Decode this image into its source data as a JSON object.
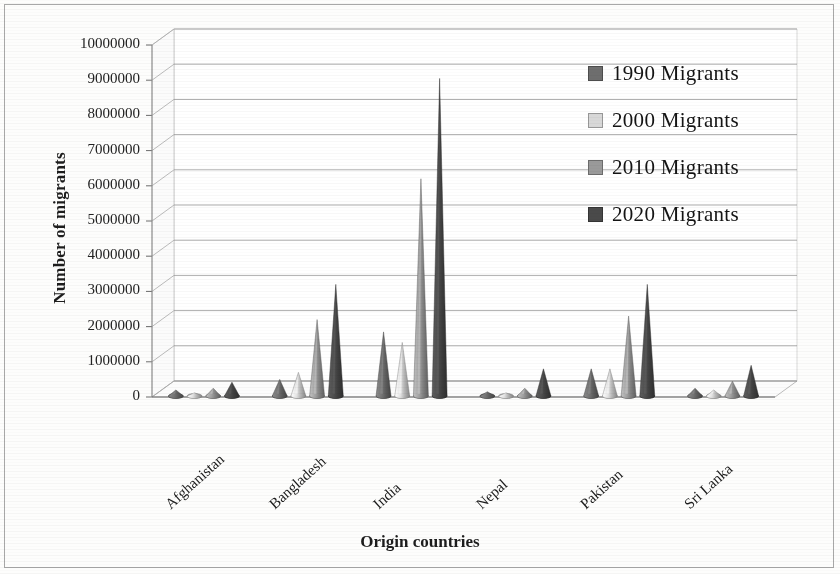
{
  "figure": {
    "background_color": "#fdfdfc",
    "frame_color": "#a8a8a8"
  },
  "axes": {
    "y_title": "Number of migrants",
    "x_title": "Origin countries",
    "y_ticks": [
      "0",
      "1000000",
      "2000000",
      "3000000",
      "4000000",
      "5000000",
      "6000000",
      "7000000",
      "8000000",
      "9000000",
      "10000000"
    ],
    "x_ticks": [
      "Afghanistan",
      "Bangladesh",
      "India",
      "Nepal",
      "Pakistan",
      "Sri Lanka"
    ]
  },
  "legend": {
    "items": [
      {
        "label": "1990 Migrants",
        "color": "#6e6e6e"
      },
      {
        "label": "2000 Migrants",
        "color": "#d8d8d8"
      },
      {
        "label": "2010 Migrants",
        "color": "#9a9a9a"
      },
      {
        "label": "2020 Migrants",
        "color": "#4a4a4a"
      }
    ]
  },
  "chart_data": {
    "type": "bar",
    "title": "",
    "subtitle": "",
    "xlabel": "Origin countries",
    "ylabel": "Number of migrants",
    "ylim": [
      0,
      10000000
    ],
    "ytick_step": 1000000,
    "grid": true,
    "legend_position": "top-right",
    "style_note": "3-D cone chart, greyscale scanned figure",
    "categories": [
      "Afghanistan",
      "Bangladesh",
      "India",
      "Nepal",
      "Pakistan",
      "Sri Lanka"
    ],
    "series": [
      {
        "name": "1990 Migrants",
        "color": "#6e6e6e",
        "values": [
          200000,
          500000,
          1850000,
          150000,
          800000,
          250000
        ]
      },
      {
        "name": "2000 Migrants",
        "color": "#d8d8d8",
        "values": [
          120000,
          700000,
          1550000,
          120000,
          800000,
          200000
        ]
      },
      {
        "name": "2010 Migrants",
        "color": "#9a9a9a",
        "values": [
          250000,
          2200000,
          6200000,
          250000,
          2300000,
          450000
        ]
      },
      {
        "name": "2020 Migrants",
        "color": "#4a4a4a",
        "values": [
          420000,
          3200000,
          9050000,
          800000,
          3200000,
          900000
        ]
      }
    ]
  }
}
